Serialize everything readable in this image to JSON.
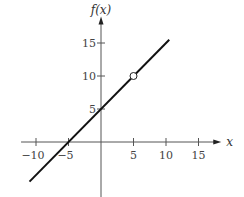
{
  "chart_data": {
    "type": "line",
    "title": "",
    "xlabel": "x",
    "ylabel": "f(x)",
    "xlim": [
      -12.3,
      18.5
    ],
    "ylim": [
      -8.5,
      19
    ],
    "x_ticks": [
      -10,
      -5,
      5,
      10,
      15
    ],
    "x_tick_labels": [
      "−10",
      "−5",
      "5",
      "10",
      "15"
    ],
    "y_ticks": [
      5,
      10,
      15
    ],
    "y_tick_labels": [
      "5",
      "10",
      "15"
    ],
    "grid": false,
    "legend": "none",
    "series": [
      {
        "name": "f(x) = x + 5",
        "x": [
          -11,
          10.5
        ],
        "y": [
          -6,
          15.5
        ],
        "color": "#111111"
      }
    ],
    "annotations": [
      {
        "type": "open-circle",
        "x": 5,
        "y": 10,
        "label": "hole at (5, 10)"
      }
    ]
  }
}
